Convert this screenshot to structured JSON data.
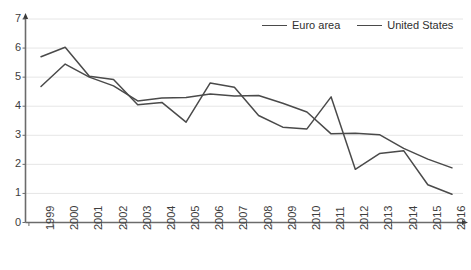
{
  "chart_data": {
    "type": "line",
    "title": "",
    "subtitle": "",
    "xlabel": "",
    "ylabel": "",
    "categories": [
      "1999",
      "2000",
      "2001",
      "2002",
      "2003",
      "2004",
      "2005",
      "2006",
      "2007",
      "2008",
      "2009",
      "2010",
      "2011",
      "2012",
      "2013",
      "2014",
      "2015",
      "2016"
    ],
    "series": [
      {
        "name": "Euro area",
        "color": "#4a4a4a",
        "values": [
          5.7,
          6.03,
          5.03,
          4.92,
          4.05,
          4.13,
          3.45,
          4.8,
          4.65,
          3.68,
          3.28,
          3.22,
          4.32,
          1.83,
          2.37,
          2.47,
          1.3,
          0.97
        ]
      },
      {
        "name": "United States",
        "color": "#4a4a4a",
        "values": [
          4.68,
          5.45,
          5.0,
          4.7,
          4.18,
          4.28,
          4.3,
          4.42,
          4.35,
          4.37,
          4.1,
          3.8,
          3.05,
          3.07,
          3.02,
          2.55,
          2.18,
          1.88
        ]
      }
    ],
    "ylim": [
      0,
      7
    ],
    "yticks": [
      0,
      1,
      2,
      3,
      4,
      5,
      6,
      7
    ],
    "ytick_labels": [
      "0",
      "1",
      "2",
      "3",
      "4",
      "5",
      "6",
      "7"
    ],
    "xtick_labels": [
      "1999",
      "2000",
      "2001",
      "2002",
      "2003",
      "2004",
      "2005",
      "2006",
      "2007",
      "2008",
      "2009",
      "2010",
      "2011",
      "2012",
      "2013",
      "2014",
      "2015",
      "2016"
    ],
    "grid": true,
    "grid_axis": "y",
    "grid_color": "#e6e6e6",
    "axis_color": "#6b6b6b",
    "legend_position": "top-right",
    "legend_entries": [
      "Euro area",
      "United States"
    ],
    "background_color": "#ffffff",
    "annotations": []
  },
  "legend": {
    "euro_area_label": "Euro area",
    "united_states_label": "United States"
  }
}
